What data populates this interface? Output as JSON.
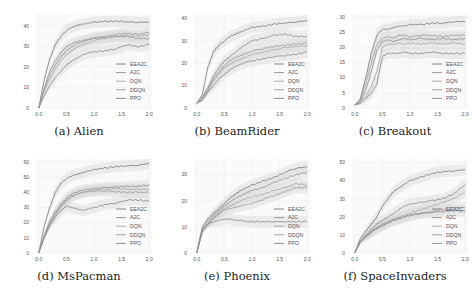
{
  "figure": {
    "legend": [
      "EEA2C",
      "A2C",
      "DQN",
      "DDQN",
      "PPO"
    ],
    "series_colors": {
      "EEA2C": "#7a7a7a",
      "A2C": "#8e8e8e",
      "DQN": "#a6a6a6",
      "DDQN": "#999999",
      "PPO": "#858585"
    },
    "band_color": "#d9d9d9",
    "grid_color": "#eeeeee"
  },
  "chart_data": [
    {
      "type": "line",
      "caption": "(a) Alien",
      "x": [
        0.0,
        0.1,
        0.2,
        0.3,
        0.4,
        0.5,
        0.6,
        0.7,
        0.8,
        0.9,
        1.0,
        1.2,
        1.4,
        1.6,
        1.8,
        2.0
      ],
      "xticks": [
        "0.0",
        "0.5",
        "1.0",
        "1.5",
        "2.0"
      ],
      "yticks": [
        "0",
        "10",
        "20",
        "30",
        "40"
      ],
      "ylim": [
        0,
        46
      ],
      "series": [
        {
          "name": "EEA2C",
          "values": [
            0,
            14,
            24,
            31,
            35,
            38,
            39.5,
            40.5,
            41,
            41.5,
            42,
            42.3,
            42.5,
            42.2,
            42,
            42
          ]
        },
        {
          "name": "A2C",
          "values": [
            0,
            10,
            18,
            23,
            27,
            30,
            31.5,
            32.5,
            33,
            33.5,
            34,
            34.5,
            35,
            35,
            34,
            34
          ]
        },
        {
          "name": "DQN",
          "values": [
            0,
            8,
            14,
            19,
            23,
            26,
            28,
            30,
            31,
            32,
            33,
            34,
            35,
            35.5,
            35,
            36
          ]
        },
        {
          "name": "DDQN",
          "values": [
            0,
            9,
            16,
            21,
            25,
            28,
            30,
            31.5,
            32.5,
            33.5,
            34.5,
            35,
            36,
            36.5,
            36,
            37
          ]
        },
        {
          "name": "PPO",
          "values": [
            0,
            6,
            11,
            15,
            18,
            21,
            23,
            24.5,
            26,
            27,
            27.5,
            28,
            29,
            31,
            30,
            31
          ]
        }
      ]
    },
    {
      "type": "line",
      "caption": "(b) BeamRider",
      "x": [
        0.0,
        0.1,
        0.2,
        0.3,
        0.4,
        0.5,
        0.6,
        0.7,
        0.8,
        0.9,
        1.0,
        1.2,
        1.4,
        1.6,
        1.8,
        2.0
      ],
      "xticks": [
        "0.0",
        "0.5",
        "1.0",
        "1.5",
        "2.0"
      ],
      "yticks": [
        "0",
        "10",
        "20",
        "30",
        "40"
      ],
      "ylim": [
        0,
        42
      ],
      "series": [
        {
          "name": "EEA2C",
          "values": [
            2,
            6,
            18,
            25,
            28,
            30,
            32,
            33,
            34,
            35,
            36,
            36.5,
            37.5,
            38,
            38.5,
            39
          ]
        },
        {
          "name": "A2C",
          "values": [
            2,
            5,
            9,
            14,
            18,
            21,
            23,
            25,
            27,
            28.5,
            30,
            31,
            32.5,
            33,
            32,
            32
          ]
        },
        {
          "name": "DQN",
          "values": [
            2,
            4,
            8,
            12,
            15,
            18,
            19.5,
            21,
            22,
            23,
            24,
            25,
            26,
            27,
            27.5,
            28
          ]
        },
        {
          "name": "DDQN",
          "values": [
            2,
            4,
            8,
            13,
            16,
            19,
            21,
            22.5,
            23.5,
            24.5,
            25.5,
            26.5,
            27.5,
            28,
            28.5,
            29
          ]
        },
        {
          "name": "PPO",
          "values": [
            2,
            3.5,
            7,
            10,
            13,
            15,
            17,
            18.5,
            19.5,
            20.5,
            21,
            22,
            23,
            23.5,
            24,
            25
          ]
        }
      ]
    },
    {
      "type": "line",
      "caption": "(c) Breakout",
      "x": [
        0.0,
        0.1,
        0.2,
        0.3,
        0.4,
        0.5,
        0.6,
        0.7,
        0.8,
        0.9,
        1.0,
        1.2,
        1.4,
        1.6,
        1.8,
        2.0
      ],
      "xticks": [
        "0.0",
        "0.5",
        "1.0",
        "1.5",
        "2.0"
      ],
      "yticks": [
        "0",
        "5",
        "10",
        "15",
        "20",
        "25",
        "30"
      ],
      "ylim": [
        0,
        31
      ],
      "series": [
        {
          "name": "EEA2C",
          "values": [
            1,
            3,
            10,
            18,
            24,
            26,
            26,
            26.5,
            27,
            27,
            27.5,
            27.5,
            28,
            28,
            28.5,
            28.5
          ]
        },
        {
          "name": "A2C",
          "values": [
            1,
            2,
            6,
            12,
            19,
            22,
            22.5,
            22,
            22.5,
            23,
            22.5,
            23,
            22.5,
            23,
            22.5,
            23
          ]
        },
        {
          "name": "DQN",
          "values": [
            1,
            2,
            4,
            7,
            12,
            20,
            21,
            21,
            21.5,
            21,
            21.5,
            21,
            21.5,
            21,
            21.5,
            21
          ]
        },
        {
          "name": "DDQN",
          "values": [
            1,
            2.5,
            8,
            15,
            21,
            23,
            23.5,
            23,
            24,
            24,
            23.5,
            24,
            24,
            23.5,
            24,
            24
          ]
        },
        {
          "name": "PPO",
          "values": [
            1,
            1.5,
            3,
            5,
            8,
            17,
            18,
            18,
            18,
            18.5,
            18,
            18,
            18.5,
            18,
            18,
            18
          ]
        }
      ]
    },
    {
      "type": "line",
      "caption": "(d) MsPacman",
      "x": [
        0.0,
        0.1,
        0.2,
        0.3,
        0.4,
        0.5,
        0.6,
        0.7,
        0.8,
        0.9,
        1.0,
        1.2,
        1.4,
        1.6,
        1.8,
        2.0
      ],
      "xticks": [
        "0.0",
        "0.5",
        "1.0",
        "1.5",
        "2.0"
      ],
      "yticks": [
        "0",
        "10",
        "20",
        "30",
        "40",
        "50",
        "60"
      ],
      "ylim": [
        0,
        62
      ],
      "series": [
        {
          "name": "EEA2C",
          "values": [
            0,
            18,
            30,
            40,
            46,
            49,
            51,
            52,
            53,
            54,
            55,
            56,
            57,
            57.5,
            58,
            59
          ]
        },
        {
          "name": "A2C",
          "values": [
            0,
            12,
            21,
            27,
            32,
            36,
            39,
            40.5,
            41.5,
            42,
            42.5,
            43,
            43.5,
            44,
            44,
            45
          ]
        },
        {
          "name": "DQN",
          "values": [
            0,
            11,
            19,
            25,
            30,
            34,
            37,
            39,
            40,
            41,
            41.5,
            42,
            42.5,
            42,
            42,
            42
          ]
        },
        {
          "name": "DDQN",
          "values": [
            0,
            11,
            20,
            26,
            31,
            35,
            37.5,
            39,
            40,
            40.5,
            41,
            41,
            40.5,
            40,
            40,
            40
          ]
        },
        {
          "name": "PPO",
          "values": [
            0,
            10,
            18,
            24,
            28,
            31,
            30,
            29,
            28,
            29,
            30,
            32,
            33,
            35,
            35,
            34
          ]
        }
      ]
    },
    {
      "type": "line",
      "caption": "(e) Phoenix",
      "x": [
        0.0,
        0.1,
        0.2,
        0.3,
        0.4,
        0.5,
        0.6,
        0.7,
        0.8,
        0.9,
        1.0,
        1.2,
        1.4,
        1.6,
        1.8,
        2.0
      ],
      "xticks": [
        "0.0",
        "0.5",
        "1.0",
        "1.5",
        "2.0"
      ],
      "yticks": [
        "0",
        "10",
        "20",
        "30"
      ],
      "ylim": [
        0,
        36
      ],
      "series": [
        {
          "name": "EEA2C",
          "values": [
            0,
            10,
            13,
            15,
            17,
            19,
            21,
            22.5,
            24,
            25,
            26,
            27.5,
            29,
            31,
            32.5,
            33
          ]
        },
        {
          "name": "A2C",
          "values": [
            0,
            9,
            12,
            14,
            16,
            18,
            19.5,
            21,
            22,
            23,
            24,
            25,
            27,
            28.5,
            30,
            31
          ]
        },
        {
          "name": "DQN",
          "values": [
            0,
            8,
            11,
            13,
            15,
            17,
            18,
            19,
            20,
            21,
            21.5,
            22.5,
            24,
            25,
            26.5,
            26
          ]
        },
        {
          "name": "DDQN",
          "values": [
            0,
            8,
            11,
            13.5,
            15,
            16.5,
            17,
            17.5,
            18,
            18.5,
            19,
            20.5,
            22,
            23.5,
            25,
            25
          ]
        },
        {
          "name": "PPO",
          "values": [
            0,
            9,
            11,
            12,
            12.5,
            13,
            13,
            12.5,
            12.5,
            12,
            12,
            12,
            12,
            12,
            12,
            12
          ]
        }
      ]
    },
    {
      "type": "line",
      "caption": "(f) SpaceInvaders",
      "x": [
        0.0,
        0.1,
        0.2,
        0.3,
        0.4,
        0.5,
        0.6,
        0.7,
        0.8,
        0.9,
        1.0,
        1.2,
        1.4,
        1.6,
        1.8,
        2.0
      ],
      "xticks": [
        "0.0",
        "0.5",
        "1.0",
        "1.5",
        "2.0"
      ],
      "yticks": [
        "0",
        "10",
        "20",
        "30",
        "40",
        "50"
      ],
      "ylim": [
        0,
        52
      ],
      "series": [
        {
          "name": "EEA2C",
          "values": [
            0,
            8,
            12,
            16,
            20,
            26,
            30,
            34,
            36,
            38,
            40,
            42,
            44,
            45,
            45.5,
            46
          ]
        },
        {
          "name": "A2C",
          "values": [
            0,
            7,
            10,
            13,
            16,
            18,
            20,
            22,
            24,
            26,
            27,
            28,
            29,
            30,
            33,
            38
          ]
        },
        {
          "name": "DQN",
          "values": [
            0,
            6,
            9,
            12,
            14,
            16,
            17.5,
            19,
            20,
            21,
            22,
            24,
            26,
            28,
            30,
            34
          ]
        },
        {
          "name": "DDQN",
          "values": [
            0,
            6,
            9,
            12,
            14,
            15.5,
            17,
            18,
            19,
            20,
            21,
            22,
            23,
            24,
            25,
            25
          ]
        },
        {
          "name": "PPO",
          "values": [
            0,
            6,
            9,
            11.5,
            13.5,
            15,
            16.5,
            18,
            19,
            20,
            21,
            22,
            22.5,
            23,
            23.5,
            23
          ]
        }
      ]
    }
  ]
}
